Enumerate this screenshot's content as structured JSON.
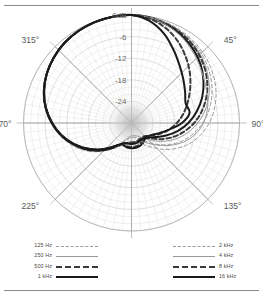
{
  "figure": {
    "name": "microphone-polar-pattern",
    "has_top_rule": true,
    "has_bottom_rule": true
  },
  "chart_data": {
    "type": "line",
    "subtype": "polar",
    "title": "",
    "xlabel": "",
    "ylabel": "",
    "unit": "dB",
    "angle_unit": "degrees",
    "grid": true,
    "legend_position": "bottom-split",
    "angle_ticks": [
      "0",
      "45",
      "90",
      "135",
      "180",
      "225",
      "270",
      "315"
    ],
    "angle_tick_suffix": "°",
    "angle_tick_labels": [
      "0°",
      "45°",
      "90°",
      "135°",
      "180°",
      "225°",
      "270°",
      "315°"
    ],
    "radial_ticks": [
      0,
      -6,
      -12,
      -18,
      -24
    ],
    "radial_tick_labels": [
      "0dB",
      "-6",
      "-12",
      "-18",
      "-24"
    ],
    "rlim": [
      -30,
      0
    ],
    "ring_step_db": 6,
    "minor_ring_step_db": 2,
    "spoke_step_deg": 5,
    "major_spoke_step_deg": 45,
    "colors": {
      "grid": "#cfcfcf",
      "major_spoke": "#a8a8a8",
      "axis_label": "#5a5a5a",
      "light_series": "#9a9a9a",
      "mid_series": "#3a3a3a",
      "dark_series": "#1a1a1a",
      "background": "#ffffff"
    },
    "series": [
      {
        "name": "125 Hz",
        "style": "fine-dashed",
        "color": "#9a9a9a",
        "width": 1,
        "angles": [
          0,
          10,
          20,
          30,
          40,
          50,
          60,
          70,
          80,
          90,
          100,
          110,
          120,
          130,
          140,
          150,
          160,
          170,
          180,
          190,
          200,
          210,
          220,
          230,
          240,
          250,
          260,
          270,
          280,
          290,
          300,
          310,
          320,
          330,
          340,
          350
        ],
        "values": [
          0,
          -0.2,
          -0.6,
          -1.2,
          -2.1,
          -3.2,
          -4.6,
          -6.2,
          -8.1,
          -10.2,
          -12.6,
          -15.2,
          -18.0,
          -20.8,
          -23.2,
          -24.8,
          -25.6,
          -25.9,
          -26.0,
          -25.6,
          -24.6,
          -22.8,
          -20.4,
          -17.6,
          -14.8,
          -12.2,
          -9.8,
          -7.6,
          -5.6,
          -4.0,
          -2.7,
          -1.7,
          -1.0,
          -0.5,
          -0.2,
          -0.05
        ]
      },
      {
        "name": "250 Hz",
        "style": "fine-solid",
        "color": "#9a9a9a",
        "width": 1,
        "angles": [
          0,
          10,
          20,
          30,
          40,
          50,
          60,
          70,
          80,
          90,
          100,
          110,
          120,
          130,
          140,
          150,
          160,
          170,
          180,
          190,
          200,
          210,
          220,
          230,
          240,
          250,
          260,
          270,
          280,
          290,
          300,
          310,
          320,
          330,
          340,
          350
        ],
        "values": [
          0,
          -0.2,
          -0.7,
          -1.4,
          -2.4,
          -3.7,
          -5.3,
          -7.1,
          -9.2,
          -11.6,
          -14.2,
          -17.0,
          -19.8,
          -22.4,
          -24.4,
          -25.6,
          -26.2,
          -26.4,
          -26.4,
          -26.0,
          -25.0,
          -23.2,
          -20.8,
          -18.0,
          -15.2,
          -12.4,
          -9.9,
          -7.6,
          -5.7,
          -4.0,
          -2.7,
          -1.7,
          -1.0,
          -0.5,
          -0.2,
          -0.05
        ]
      },
      {
        "name": "500 Hz",
        "style": "bold-dashed",
        "color": "#3a3a3a",
        "width": 2,
        "angles": [
          0,
          10,
          20,
          30,
          40,
          50,
          60,
          70,
          80,
          90,
          100,
          110,
          120,
          130,
          140,
          150,
          160,
          170,
          180,
          190,
          200,
          210,
          220,
          230,
          240,
          250,
          260,
          270,
          280,
          290,
          300,
          310,
          320,
          330,
          340,
          350
        ],
        "values": [
          0,
          -0.2,
          -0.8,
          -1.6,
          -2.7,
          -4.1,
          -5.8,
          -7.8,
          -10.1,
          -12.6,
          -15.4,
          -18.2,
          -21.0,
          -23.4,
          -24.6,
          -24.2,
          -23.6,
          -23.4,
          -23.4,
          -23.4,
          -23.6,
          -23.0,
          -21.2,
          -18.6,
          -15.8,
          -12.9,
          -10.2,
          -7.9,
          -5.8,
          -4.1,
          -2.8,
          -1.8,
          -1.0,
          -0.5,
          -0.2,
          -0.05
        ]
      },
      {
        "name": "1 kHz",
        "style": "bold-solid",
        "color": "#1a1a1a",
        "width": 2,
        "angles": [
          0,
          10,
          20,
          30,
          40,
          50,
          60,
          70,
          80,
          90,
          100,
          110,
          120,
          130,
          140,
          150,
          160,
          170,
          180,
          190,
          200,
          210,
          220,
          230,
          240,
          250,
          260,
          270,
          280,
          290,
          300,
          310,
          320,
          330,
          340,
          350
        ],
        "values": [
          0,
          -0.3,
          -1.0,
          -2.0,
          -3.3,
          -4.9,
          -6.9,
          -9.1,
          -11.6,
          -14.2,
          -17.0,
          -19.8,
          -22.2,
          -23.8,
          -24.2,
          -23.6,
          -23.2,
          -23.0,
          -23.0,
          -23.1,
          -23.4,
          -23.0,
          -21.2,
          -18.6,
          -15.8,
          -13.0,
          -10.3,
          -8.0,
          -5.9,
          -4.2,
          -2.8,
          -1.8,
          -1.0,
          -0.5,
          -0.2,
          -0.05
        ]
      },
      {
        "name": "2 kHz",
        "style": "fine-dashed",
        "color": "#9a9a9a",
        "width": 1,
        "angles": [
          0,
          10,
          20,
          30,
          40,
          50,
          60,
          70,
          80,
          90,
          100,
          110,
          120,
          130,
          140,
          150,
          160,
          170,
          180,
          190,
          200,
          210,
          220,
          230,
          240,
          250,
          260,
          270,
          280,
          290,
          300,
          310,
          320,
          330,
          340,
          350
        ],
        "values": [
          0,
          -0.2,
          -0.5,
          -1.0,
          -1.7,
          -2.6,
          -3.7,
          -5.0,
          -6.6,
          -8.4,
          -10.6,
          -13.0,
          -15.8,
          -18.6,
          -21.2,
          -23.0,
          -24.0,
          -24.4,
          -24.4,
          -24.2,
          -23.6,
          -22.2,
          -20.2,
          -17.8,
          -15.2,
          -12.6,
          -10.2,
          -7.9,
          -5.9,
          -4.2,
          -2.8,
          -1.8,
          -1.0,
          -0.5,
          -0.2,
          -0.05
        ]
      },
      {
        "name": "4 kHz",
        "style": "fine-solid",
        "color": "#9a9a9a",
        "width": 1,
        "angles": [
          0,
          10,
          20,
          30,
          40,
          50,
          60,
          70,
          80,
          90,
          100,
          110,
          120,
          130,
          140,
          150,
          160,
          170,
          180,
          190,
          200,
          210,
          220,
          230,
          240,
          250,
          260,
          270,
          280,
          290,
          300,
          310,
          320,
          330,
          340,
          350
        ],
        "values": [
          0,
          -0.3,
          -1.1,
          -2.3,
          -3.8,
          -5.3,
          -6.6,
          -7.6,
          -8.6,
          -10.0,
          -12.0,
          -14.6,
          -17.6,
          -20.4,
          -22.6,
          -24.0,
          -24.6,
          -24.8,
          -24.8,
          -24.6,
          -24.0,
          -22.6,
          -20.4,
          -18.0,
          -15.4,
          -12.8,
          -10.3,
          -8.0,
          -5.9,
          -4.2,
          -2.8,
          -1.8,
          -1.0,
          -0.5,
          -0.2,
          -0.05
        ]
      },
      {
        "name": "8 kHz",
        "style": "bold-dashed",
        "color": "#3a3a3a",
        "width": 2,
        "angles": [
          0,
          10,
          20,
          30,
          40,
          50,
          60,
          70,
          80,
          90,
          100,
          110,
          120,
          130,
          140,
          150,
          160,
          170,
          180,
          190,
          200,
          210,
          220,
          230,
          240,
          250,
          260,
          270,
          280,
          290,
          300,
          310,
          320,
          330,
          340,
          350
        ],
        "values": [
          0,
          -0.6,
          -2.0,
          -4.0,
          -6.4,
          -8.8,
          -11.2,
          -13.4,
          -15.4,
          -17.4,
          -19.4,
          -21.4,
          -23.2,
          -24.4,
          -25.0,
          -25.0,
          -24.8,
          -24.6,
          -24.6,
          -24.4,
          -24.0,
          -22.8,
          -20.6,
          -18.0,
          -15.4,
          -12.8,
          -10.2,
          -7.9,
          -5.8,
          -4.1,
          -2.8,
          -1.8,
          -1.0,
          -0.5,
          -0.2,
          -0.05
        ]
      },
      {
        "name": "16 kHz",
        "style": "bold-solid",
        "color": "#1a1a1a",
        "width": 2,
        "angles": [
          0,
          10,
          20,
          30,
          40,
          50,
          60,
          70,
          80,
          90,
          100,
          110,
          120,
          130,
          140,
          150,
          160,
          170,
          180,
          190,
          200,
          210,
          220,
          230,
          240,
          250,
          260,
          270,
          280,
          290,
          300,
          310,
          320,
          330,
          340,
          350
        ],
        "values": [
          0,
          -1.2,
          -3.6,
          -6.6,
          -9.2,
          -11.2,
          -12.8,
          -14.0,
          -13.6,
          -16.0,
          -19.4,
          -21.8,
          -23.4,
          -24.2,
          -24.6,
          -24.6,
          -24.4,
          -24.2,
          -24.2,
          -24.2,
          -24.0,
          -23.0,
          -20.8,
          -18.2,
          -15.4,
          -12.8,
          -10.2,
          -7.9,
          -5.8,
          -4.1,
          -2.8,
          -1.8,
          -1.0,
          -0.5,
          -0.2,
          -0.05
        ]
      }
    ]
  },
  "legend": {
    "left_column": [
      {
        "label": "125 Hz",
        "swatch": "sw-125"
      },
      {
        "label": "250 Hz",
        "swatch": "sw-250"
      },
      {
        "label": "500 Hz",
        "swatch": "sw-500"
      },
      {
        "label": "1 kHz",
        "swatch": "sw-1k"
      }
    ],
    "right_column": [
      {
        "label": "2 kHz",
        "swatch": "sw-2k"
      },
      {
        "label": "4 kHz",
        "swatch": "sw-4k"
      },
      {
        "label": "8 kHz",
        "swatch": "sw-8k"
      },
      {
        "label": "16 kHz",
        "swatch": "sw-16k"
      }
    ]
  }
}
